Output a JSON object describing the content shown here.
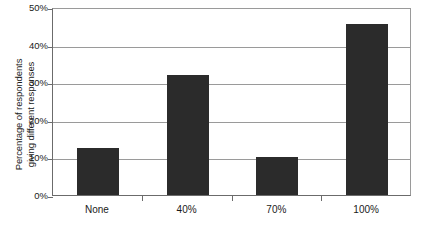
{
  "chart_data": {
    "type": "bar",
    "title": "",
    "subtitle": "",
    "xlabel": "",
    "ylabel_line1": "Percentage of respondents",
    "ylabel_line2": "giving different responses",
    "categories": [
      "None",
      "40%",
      "70%",
      "100%"
    ],
    "values": [
      12.5,
      32.0,
      10.0,
      45.5
    ],
    "ylim": [
      0,
      50
    ],
    "ytick_labels": [
      "0%",
      "10%",
      "20%",
      "30%",
      "40%",
      "50%"
    ],
    "ytick_values": [
      0,
      10,
      20,
      30,
      40,
      50
    ],
    "grid": true,
    "legend": "none",
    "bar_color": "#2b2b2b",
    "axis_color": "#6b6b6b",
    "grid_color": "#9a9a9a",
    "background_color": "#ffffff"
  }
}
